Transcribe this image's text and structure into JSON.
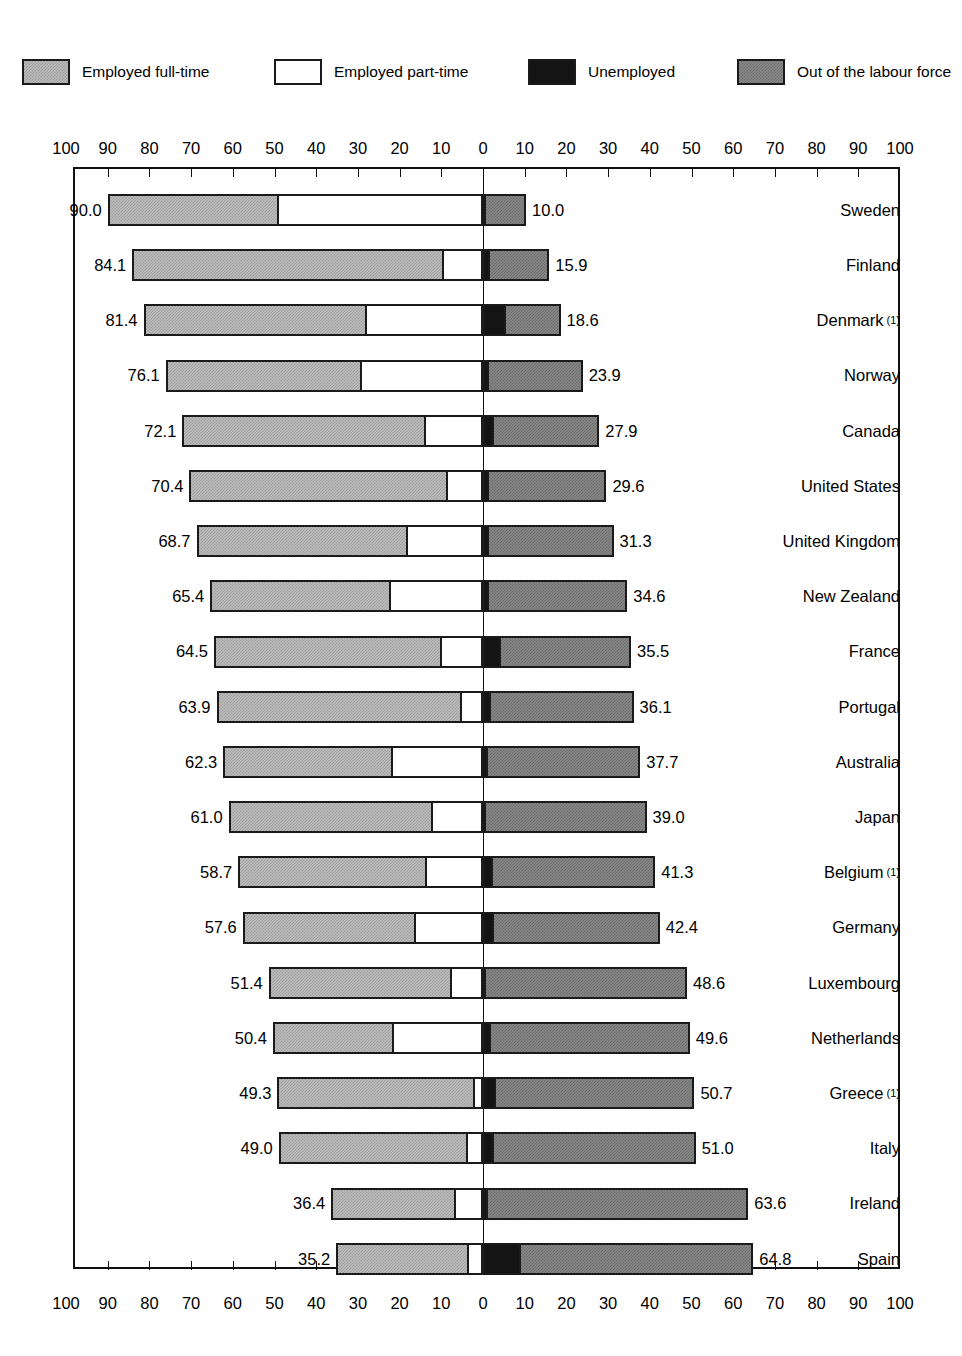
{
  "legend": {
    "items": [
      {
        "key": "full_time",
        "label": "Employed full-time",
        "swatch": "light-gray-hatch",
        "color": "#bdbdbd",
        "x": 22
      },
      {
        "key": "part_time",
        "label": "Employed part-time",
        "swatch": "white",
        "color": "#ffffff",
        "x": 274
      },
      {
        "key": "unemployed",
        "label": "Unemployed",
        "swatch": "black",
        "color": "#141414",
        "x": 528
      },
      {
        "key": "out_of_lf",
        "label": "Out of the labour force",
        "swatch": "dark-gray-hatch",
        "color": "#888888",
        "x": 737
      }
    ]
  },
  "axis": {
    "tick_labels": [
      "100",
      "90",
      "80",
      "70",
      "60",
      "50",
      "40",
      "30",
      "20",
      "10",
      "0",
      "10",
      "20",
      "30",
      "40",
      "50",
      "60",
      "70",
      "80",
      "90",
      "100"
    ],
    "tick_values": [
      -100,
      -90,
      -80,
      -70,
      -60,
      -50,
      -40,
      -30,
      -20,
      -10,
      0,
      10,
      20,
      30,
      40,
      50,
      60,
      70,
      80,
      90,
      100
    ],
    "top_y": 140,
    "bottom_y": 1285,
    "zero_px": 483,
    "px_per_unit": 4.17
  },
  "chart_data": {
    "type": "bar",
    "orientation": "horizontal",
    "subtype": "diverging-stacked",
    "title": "",
    "xlabel": "",
    "ylabel": "",
    "xlim": [
      -100,
      100
    ],
    "grid": false,
    "legend_position": "top",
    "axis_note": "Left side = in labour force (employed full-time + part-time); right side = unemployed + out of the labour force",
    "categories": [
      "Sweden",
      "Finland",
      "Denmark",
      "Norway",
      "Canada",
      "United States",
      "United Kingdom",
      "New Zealand",
      "France",
      "Portugal",
      "Australia",
      "Japan",
      "Belgium",
      "Germany",
      "Luxembourg",
      "Netherlands",
      "Greece",
      "Italy",
      "Ireland",
      "Spain"
    ],
    "series": [
      {
        "name": "Employed full-time",
        "values": [
          41.0,
          74.8,
          53.7,
          47.2,
          58.4,
          62.0,
          50.7,
          43.4,
          54.6,
          58.8,
          40.8,
          49.0,
          45.3,
          41.5,
          44.0,
          29.1,
          47.5,
          45.4,
          29.9,
          31.8
        ]
      },
      {
        "name": "Employed part-time",
        "values": [
          49.0,
          9.3,
          27.7,
          28.9,
          13.7,
          8.4,
          18.0,
          22.0,
          9.9,
          5.1,
          21.5,
          12.0,
          13.4,
          16.1,
          7.4,
          21.3,
          1.8,
          3.6,
          6.5,
          3.4
        ]
      },
      {
        "name": "Unemployed",
        "values": [
          0.4,
          1.6,
          5.4,
          1.4,
          2.7,
          1.5,
          1.5,
          1.5,
          4.4,
          1.8,
          1.2,
          0.5,
          2.3,
          2.6,
          0.4,
          2.0,
          3.2,
          2.7,
          1.3,
          9.0
        ]
      },
      {
        "name": "Out of the labour force",
        "values": [
          9.6,
          14.3,
          13.2,
          22.5,
          25.2,
          28.1,
          29.8,
          33.1,
          31.1,
          34.3,
          36.5,
          38.5,
          39.0,
          39.8,
          48.2,
          47.6,
          47.5,
          48.3,
          62.3,
          55.8
        ]
      }
    ],
    "left_totals": [
      90.0,
      84.1,
      81.4,
      76.1,
      72.1,
      70.4,
      68.7,
      65.4,
      64.5,
      63.9,
      62.3,
      61.0,
      58.7,
      57.6,
      51.4,
      50.4,
      49.3,
      49.0,
      36.4,
      35.2
    ],
    "right_totals": [
      10.0,
      15.9,
      18.6,
      23.9,
      27.9,
      29.6,
      31.3,
      34.6,
      35.5,
      36.1,
      37.7,
      39.0,
      41.3,
      42.4,
      48.6,
      49.6,
      50.7,
      51.0,
      63.6,
      64.8
    ]
  },
  "rows": [
    {
      "country": "Sweden",
      "footnote": "",
      "left_label": "90.0",
      "right_label": "10.0",
      "full_time": 41.0,
      "part_time": 49.0,
      "unemployed": 0.4,
      "out_of_lf": 9.6,
      "left_total": 90.0,
      "right_total": 10.0
    },
    {
      "country": "Finland",
      "footnote": "",
      "left_label": "84.1",
      "right_label": "15.9",
      "full_time": 74.8,
      "part_time": 9.3,
      "unemployed": 1.6,
      "out_of_lf": 14.3,
      "left_total": 84.1,
      "right_total": 15.9
    },
    {
      "country": "Denmark",
      "footnote": "(1)",
      "left_label": "81.4",
      "right_label": "18.6",
      "full_time": 53.7,
      "part_time": 27.7,
      "unemployed": 5.4,
      "out_of_lf": 13.2,
      "left_total": 81.4,
      "right_total": 18.6
    },
    {
      "country": "Norway",
      "footnote": "",
      "left_label": "76.1",
      "right_label": "23.9",
      "full_time": 47.2,
      "part_time": 28.9,
      "unemployed": 1.4,
      "out_of_lf": 22.5,
      "left_total": 76.1,
      "right_total": 23.9
    },
    {
      "country": "Canada",
      "footnote": "",
      "left_label": "72.1",
      "right_label": "27.9",
      "full_time": 58.4,
      "part_time": 13.7,
      "unemployed": 2.7,
      "out_of_lf": 25.2,
      "left_total": 72.1,
      "right_total": 27.9
    },
    {
      "country": "United States",
      "footnote": "",
      "left_label": "70.4",
      "right_label": "29.6",
      "full_time": 62.0,
      "part_time": 8.4,
      "unemployed": 1.5,
      "out_of_lf": 28.1,
      "left_total": 70.4,
      "right_total": 29.6
    },
    {
      "country": "United Kingdom",
      "footnote": "",
      "left_label": "68.7",
      "right_label": "31.3",
      "full_time": 50.7,
      "part_time": 18.0,
      "unemployed": 1.5,
      "out_of_lf": 29.8,
      "left_total": 68.7,
      "right_total": 31.3
    },
    {
      "country": "New Zealand",
      "footnote": "",
      "left_label": "65.4",
      "right_label": "34.6",
      "full_time": 43.4,
      "part_time": 22.0,
      "unemployed": 1.5,
      "out_of_lf": 33.1,
      "left_total": 65.4,
      "right_total": 34.6
    },
    {
      "country": "France",
      "footnote": "",
      "left_label": "64.5",
      "right_label": "35.5",
      "full_time": 54.6,
      "part_time": 9.9,
      "unemployed": 4.4,
      "out_of_lf": 31.1,
      "left_total": 64.5,
      "right_total": 35.5
    },
    {
      "country": "Portugal",
      "footnote": "",
      "left_label": "63.9",
      "right_label": "36.1",
      "full_time": 58.8,
      "part_time": 5.1,
      "unemployed": 1.8,
      "out_of_lf": 34.3,
      "left_total": 63.9,
      "right_total": 36.1
    },
    {
      "country": "Australia",
      "footnote": "",
      "left_label": "62.3",
      "right_label": "37.7",
      "full_time": 40.8,
      "part_time": 21.5,
      "unemployed": 1.2,
      "out_of_lf": 36.5,
      "left_total": 62.3,
      "right_total": 37.7
    },
    {
      "country": "Japan",
      "footnote": "",
      "left_label": "61.0",
      "right_label": "39.0",
      "full_time": 49.0,
      "part_time": 12.0,
      "unemployed": 0.5,
      "out_of_lf": 38.5,
      "left_total": 61.0,
      "right_total": 39.0
    },
    {
      "country": "Belgium",
      "footnote": "(1)",
      "left_label": "58.7",
      "right_label": "41.3",
      "full_time": 45.3,
      "part_time": 13.4,
      "unemployed": 2.3,
      "out_of_lf": 39.0,
      "left_total": 58.7,
      "right_total": 41.3
    },
    {
      "country": "Germany",
      "footnote": "",
      "left_label": "57.6",
      "right_label": "42.4",
      "full_time": 41.5,
      "part_time": 16.1,
      "unemployed": 2.6,
      "out_of_lf": 39.8,
      "left_total": 57.6,
      "right_total": 42.4
    },
    {
      "country": "Luxembourg",
      "footnote": "",
      "left_label": "51.4",
      "right_label": "48.6",
      "full_time": 44.0,
      "part_time": 7.4,
      "unemployed": 0.4,
      "out_of_lf": 48.2,
      "left_total": 51.4,
      "right_total": 48.6
    },
    {
      "country": "Netherlands",
      "footnote": "",
      "left_label": "50.4",
      "right_label": "49.6",
      "full_time": 29.1,
      "part_time": 21.3,
      "unemployed": 2.0,
      "out_of_lf": 47.6,
      "left_total": 50.4,
      "right_total": 49.6
    },
    {
      "country": "Greece",
      "footnote": "(1)",
      "left_label": "49.3",
      "right_label": "50.7",
      "full_time": 47.5,
      "part_time": 1.8,
      "unemployed": 3.2,
      "out_of_lf": 47.5,
      "left_total": 49.3,
      "right_total": 50.7
    },
    {
      "country": "Italy",
      "footnote": "",
      "left_label": "49.0",
      "right_label": "51.0",
      "full_time": 45.4,
      "part_time": 3.6,
      "unemployed": 2.7,
      "out_of_lf": 48.3,
      "left_total": 49.0,
      "right_total": 51.0
    },
    {
      "country": "Ireland",
      "footnote": "",
      "left_label": "36.4",
      "right_label": "63.6",
      "full_time": 29.9,
      "part_time": 6.5,
      "unemployed": 1.3,
      "out_of_lf": 62.3,
      "left_total": 36.4,
      "right_total": 63.6
    },
    {
      "country": "Spain",
      "footnote": "",
      "left_label": "35.2",
      "right_label": "64.8",
      "full_time": 31.8,
      "part_time": 3.4,
      "unemployed": 9.0,
      "out_of_lf": 55.8,
      "left_total": 35.2,
      "right_total": 64.8
    }
  ]
}
